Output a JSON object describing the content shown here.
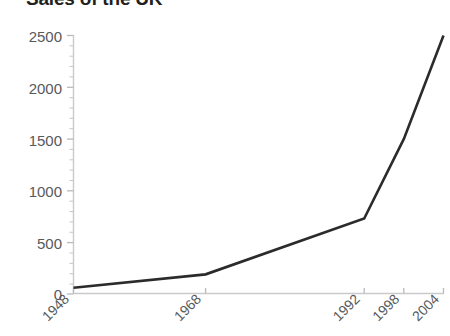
{
  "chart_data": {
    "type": "line",
    "title": "Sales of the UK",
    "xlabel": "",
    "ylabel": "",
    "x": [
      1948,
      1968,
      1992,
      1998,
      2004
    ],
    "categories": [
      "1948",
      "1968",
      "1992",
      "1998",
      "2004"
    ],
    "values": [
      60,
      190,
      730,
      1500,
      2500
    ],
    "series": [
      {
        "name": "Sales",
        "values": [
          60,
          190,
          730,
          1500,
          2500
        ]
      }
    ],
    "ylim": [
      0,
      2500
    ],
    "xlim": [
      1948,
      2004
    ],
    "ytick_labels": [
      "0",
      "500",
      "1000",
      "1500",
      "2000",
      "2500"
    ],
    "ytick_values": [
      0,
      500,
      1000,
      1500,
      2000,
      2500
    ],
    "yminor_step": 100,
    "xtick_labels": [
      "1948",
      "1968",
      "1992",
      "1998",
      "2004"
    ],
    "xtick_values": [
      1948,
      1968,
      1992,
      1998,
      2004
    ],
    "xtick_rotation": "45",
    "grid": false,
    "legend": false,
    "legend_position": "none",
    "line_color": "#2b2b2b",
    "axis_color": "#c9cacc",
    "label_color": "#58595b",
    "title_color": "#231f20",
    "background_color": "#ffffff"
  }
}
